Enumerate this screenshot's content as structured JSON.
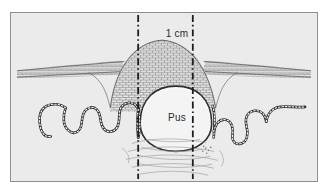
{
  "figure": {
    "domain": "medical-histology-diagram",
    "title_visible": false,
    "frame": {
      "background_color": "#ebebeb",
      "border_color": "#8f8f8f",
      "outer_background": "#ffffff"
    },
    "labels": [
      {
        "name": "scale-label",
        "text": "1 cm",
        "role": "scale-measurement-between-dashed-lines"
      },
      {
        "name": "pus-label",
        "text": "Pus",
        "role": "cavity-content-annotation"
      }
    ],
    "measurement": {
      "value": "1 cm",
      "left_marker_x": 138,
      "right_marker_x": 193,
      "marker_style": "dash-dot-vertical"
    },
    "structures": [
      {
        "name": "keratin-layer",
        "description": "horizontal striated bands across upper region",
        "color": "#6d6d6d"
      },
      {
        "name": "epidermal-dome",
        "description": "raised stippled cellular mound over the lesion",
        "color": "#555555",
        "fill": "#e2e2e2"
      },
      {
        "name": "basal-membrane",
        "description": "beaded wavy line forming rete ridges",
        "color": "#333333"
      },
      {
        "name": "pus-cavity",
        "description": "central oval abscess cavity filled with pus",
        "fill": "#f2f2f2",
        "outline": "#2a2a2a"
      },
      {
        "name": "dermal-fibres",
        "description": "wispy horizontal fibrous strands beneath the cavity",
        "color": "#9a9a9a"
      }
    ],
    "colors": {
      "ink": "#333333",
      "ink_light": "#8a8a8a",
      "background": "#ebebeb",
      "cavity_fill": "#f2f2f2",
      "dome_fill": "#e3e3e3"
    }
  }
}
